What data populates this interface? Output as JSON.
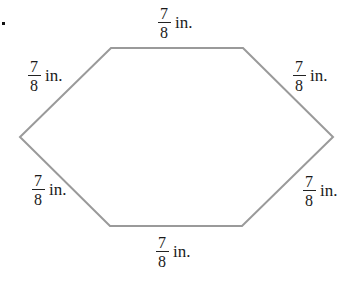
{
  "figure": {
    "marker": ".",
    "shape": "hexagon",
    "stroke_color": "#9a9a9a",
    "vertices": [
      [
        111,
        48
      ],
      [
        243,
        48
      ],
      [
        333,
        137
      ],
      [
        242,
        226
      ],
      [
        110,
        226
      ],
      [
        20,
        137
      ]
    ],
    "side_labels": [
      {
        "position": "top",
        "numerator": "7",
        "denominator": "8",
        "unit": "in."
      },
      {
        "position": "top-left",
        "numerator": "7",
        "denominator": "8",
        "unit": "in."
      },
      {
        "position": "top-right",
        "numerator": "7",
        "denominator": "8",
        "unit": "in."
      },
      {
        "position": "bottom-left",
        "numerator": "7",
        "denominator": "8",
        "unit": "in."
      },
      {
        "position": "bottom-right",
        "numerator": "7",
        "denominator": "8",
        "unit": "in."
      },
      {
        "position": "bottom",
        "numerator": "7",
        "denominator": "8",
        "unit": "in."
      }
    ]
  }
}
